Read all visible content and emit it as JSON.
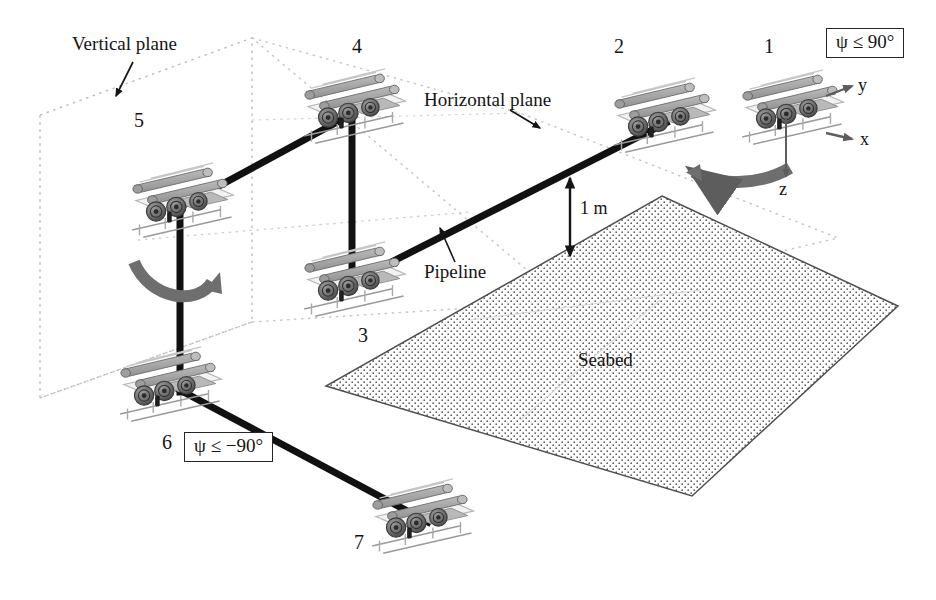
{
  "figure": {
    "background_color": "#ffffff",
    "ink_color": "#151515",
    "pipeline_color": "#111111",
    "plane_outline_color": "#b8b8b8",
    "seabed_outline_color": "#4a4a4a",
    "seabed_dot_color": "#5a5a5a",
    "arrow_fill_color": "#6e6e6e"
  },
  "annotations": {
    "vertical_plane": "Vertical plane",
    "horizontal_plane": "Horizontal plane",
    "pipeline": "Pipeline",
    "seabed": "Seabed",
    "height_dimension": "1 m"
  },
  "axes": {
    "x": "x",
    "y": "y",
    "z": "z"
  },
  "constraints": [
    {
      "id": "psi-upper",
      "text": "ψ ≤ 90°"
    },
    {
      "id": "psi-lower",
      "text": "ψ ≤ −90°"
    }
  ],
  "waypoints": [
    {
      "id": 1,
      "label": "1"
    },
    {
      "id": 2,
      "label": "2"
    },
    {
      "id": 3,
      "label": "3"
    },
    {
      "id": 4,
      "label": "4"
    },
    {
      "id": 5,
      "label": "5"
    },
    {
      "id": 6,
      "label": "6"
    },
    {
      "id": 7,
      "label": "7"
    }
  ]
}
